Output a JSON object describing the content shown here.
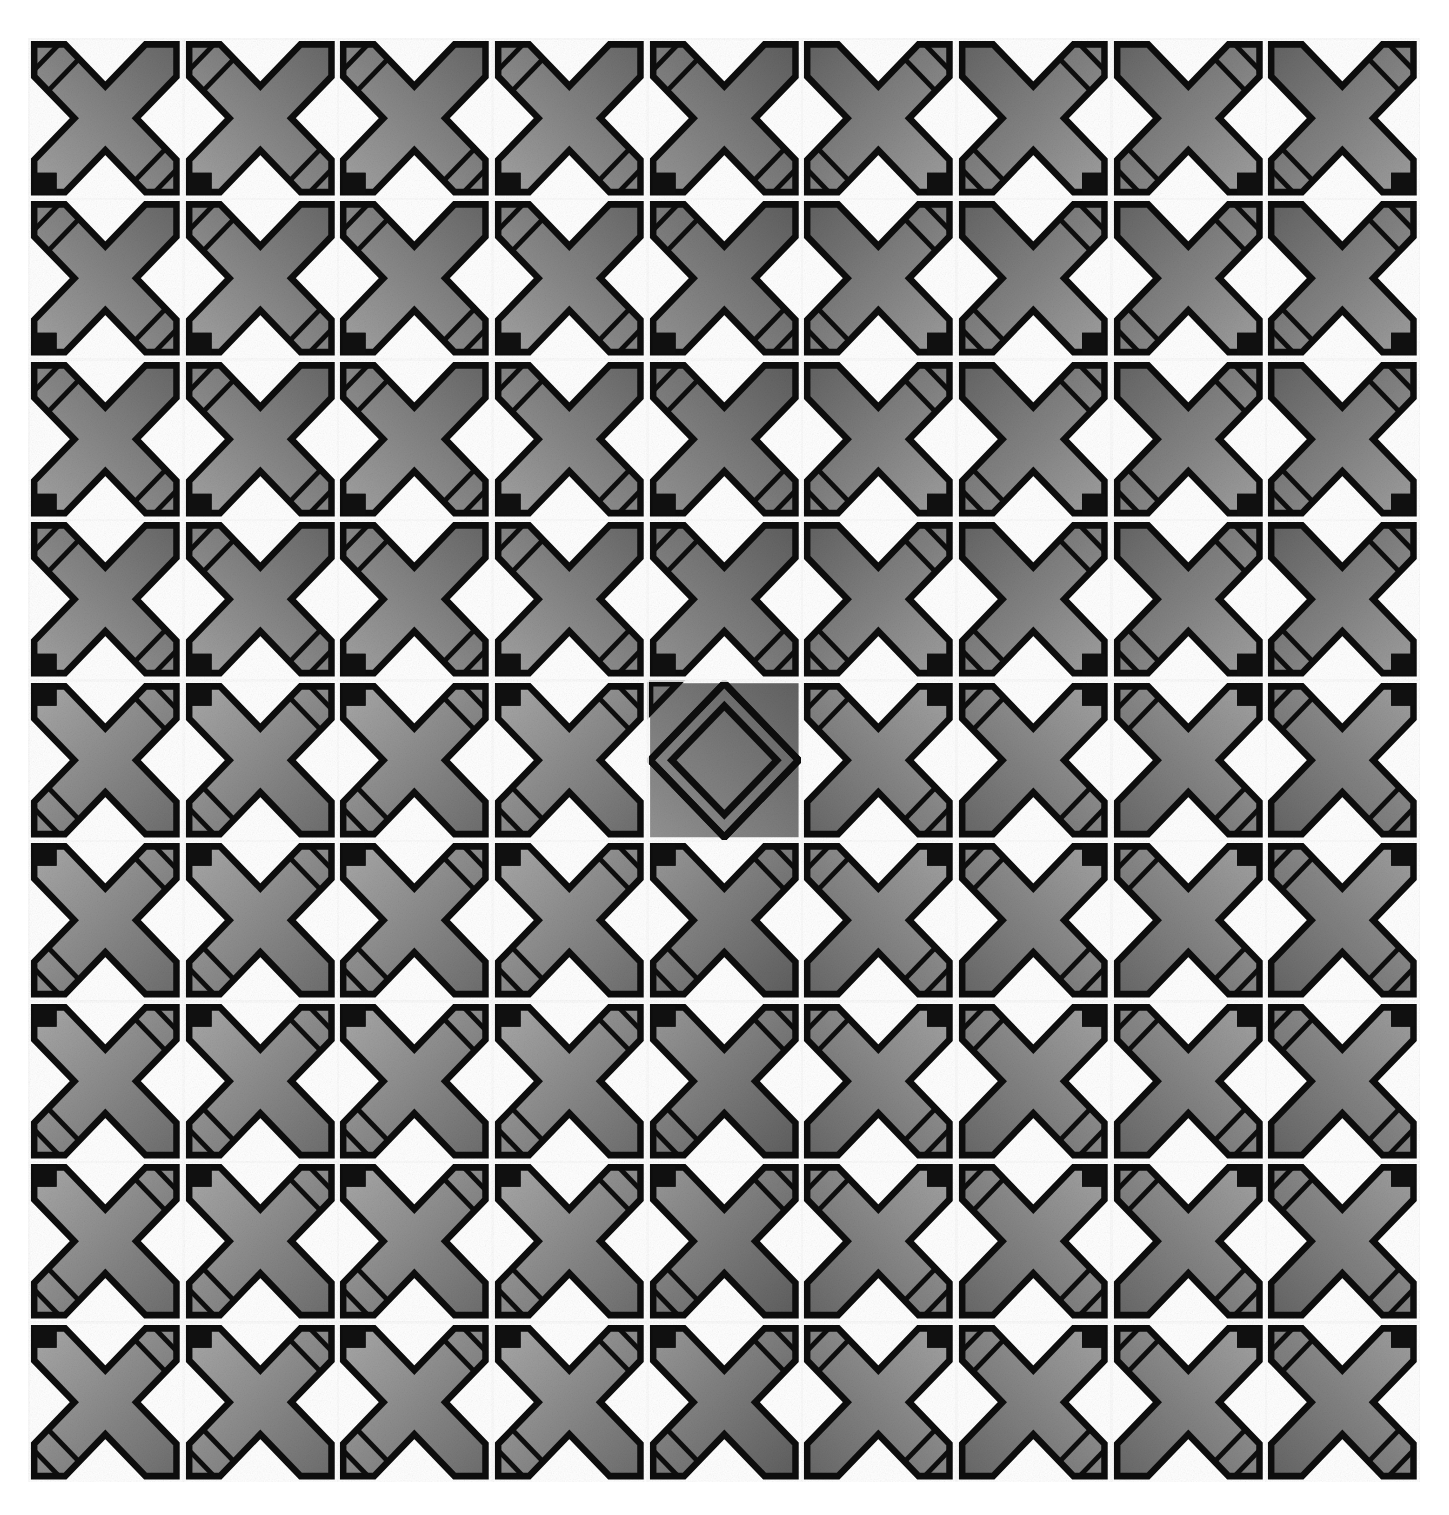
{
  "image": {
    "kind": "texture-pattern-grid",
    "description": "Grayscale grid of embossed metal-plate style cross tiles",
    "background_color": "#ffffff",
    "grid": {
      "columns": 9,
      "rows": 9,
      "left": 28,
      "top": 38,
      "width": 1392,
      "height": 1444,
      "gridline_color": "#fafafa"
    },
    "palette": {
      "tile_light": "#b4b4b4",
      "tile_mid": "#8c8c8c",
      "tile_dark": "#5e5e5e",
      "outline": "#0d0d0d",
      "gap": "#ffffff",
      "corner_stud": "#101010"
    },
    "tile_variants": {
      "cross": "cross-plate-tile",
      "diamond": "diamond-plate-tile"
    },
    "quadrant_orientations": {
      "top_left": "o-tl",
      "top_right": "o-tr",
      "bottom_left": "o-bl",
      "bottom_right": "o-br"
    },
    "anomaly": {
      "row": 5,
      "col": 5,
      "variant": "diamond",
      "note": "concentric rotated-square tile differs from surrounding cross tiles"
    }
  },
  "chart_data": {
    "type": "heatmap",
    "title": "",
    "xlabel": "",
    "ylabel": "",
    "categories_x": [
      "1",
      "2",
      "3",
      "4",
      "5",
      "6",
      "7",
      "8",
      "9"
    ],
    "categories_y": [
      "1",
      "2",
      "3",
      "4",
      "5",
      "6",
      "7",
      "8",
      "9"
    ],
    "legend": [],
    "grid": true,
    "cells": [
      [
        {
          "v": "cross",
          "o": "o-tl",
          "t": 0.55
        },
        {
          "v": "cross",
          "o": "o-tl",
          "t": 0.55
        },
        {
          "v": "cross",
          "o": "o-tl",
          "t": 0.55
        },
        {
          "v": "cross",
          "o": "o-tl",
          "t": 0.55
        },
        {
          "v": "cross",
          "o": "o-tl",
          "t": 0.7
        },
        {
          "v": "cross",
          "o": "o-tr",
          "t": 0.6
        },
        {
          "v": "cross",
          "o": "o-tr",
          "t": 0.58
        },
        {
          "v": "cross",
          "o": "o-tr",
          "t": 0.58
        },
        {
          "v": "cross",
          "o": "o-tr",
          "t": 0.6
        }
      ],
      [
        {
          "v": "cross",
          "o": "o-tl",
          "t": 0.55
        },
        {
          "v": "cross",
          "o": "o-tl",
          "t": 0.55
        },
        {
          "v": "cross",
          "o": "o-tl",
          "t": 0.55
        },
        {
          "v": "cross",
          "o": "o-tl",
          "t": 0.55
        },
        {
          "v": "cross",
          "o": "o-tl",
          "t": 0.72
        },
        {
          "v": "cross",
          "o": "o-tr",
          "t": 0.62
        },
        {
          "v": "cross",
          "o": "o-tr",
          "t": 0.58
        },
        {
          "v": "cross",
          "o": "o-tr",
          "t": 0.58
        },
        {
          "v": "cross",
          "o": "o-tr",
          "t": 0.6
        }
      ],
      [
        {
          "v": "cross",
          "o": "o-tl",
          "t": 0.55
        },
        {
          "v": "cross",
          "o": "o-tl",
          "t": 0.55
        },
        {
          "v": "cross",
          "o": "o-tl",
          "t": 0.55
        },
        {
          "v": "cross",
          "o": "o-tl",
          "t": 0.55
        },
        {
          "v": "cross",
          "o": "o-tl",
          "t": 0.72
        },
        {
          "v": "cross",
          "o": "o-tr",
          "t": 0.6
        },
        {
          "v": "cross",
          "o": "o-tr",
          "t": 0.58
        },
        {
          "v": "cross",
          "o": "o-tr",
          "t": 0.58
        },
        {
          "v": "cross",
          "o": "o-tr",
          "t": 0.6
        }
      ],
      [
        {
          "v": "cross",
          "o": "o-tl",
          "t": 0.55
        },
        {
          "v": "cross",
          "o": "o-tl",
          "t": 0.55
        },
        {
          "v": "cross",
          "o": "o-tl",
          "t": 0.55
        },
        {
          "v": "cross",
          "o": "o-tl",
          "t": 0.55
        },
        {
          "v": "cross",
          "o": "o-tl",
          "t": 0.72
        },
        {
          "v": "cross",
          "o": "o-tr",
          "t": 0.6
        },
        {
          "v": "cross",
          "o": "o-tr",
          "t": 0.58
        },
        {
          "v": "cross",
          "o": "o-tr",
          "t": 0.58
        },
        {
          "v": "cross",
          "o": "o-tr",
          "t": 0.6
        }
      ],
      [
        {
          "v": "cross",
          "o": "o-bl",
          "t": 0.48
        },
        {
          "v": "cross",
          "o": "o-bl",
          "t": 0.48
        },
        {
          "v": "cross",
          "o": "o-bl",
          "t": 0.48
        },
        {
          "v": "cross",
          "o": "o-bl",
          "t": 0.48
        },
        {
          "v": "diamond",
          "o": "o-tl",
          "t": 0.7
        },
        {
          "v": "cross",
          "o": "o-br",
          "t": 0.55
        },
        {
          "v": "cross",
          "o": "o-br",
          "t": 0.55
        },
        {
          "v": "cross",
          "o": "o-br",
          "t": 0.55
        },
        {
          "v": "cross",
          "o": "o-br",
          "t": 0.58
        }
      ],
      [
        {
          "v": "cross",
          "o": "o-bl",
          "t": 0.48
        },
        {
          "v": "cross",
          "o": "o-bl",
          "t": 0.48
        },
        {
          "v": "cross",
          "o": "o-bl",
          "t": 0.48
        },
        {
          "v": "cross",
          "o": "o-bl",
          "t": 0.48
        },
        {
          "v": "cross",
          "o": "o-bl",
          "t": 0.66
        },
        {
          "v": "cross",
          "o": "o-br",
          "t": 0.55
        },
        {
          "v": "cross",
          "o": "o-br",
          "t": 0.55
        },
        {
          "v": "cross",
          "o": "o-br",
          "t": 0.55
        },
        {
          "v": "cross",
          "o": "o-br",
          "t": 0.58
        }
      ],
      [
        {
          "v": "cross",
          "o": "o-bl",
          "t": 0.48
        },
        {
          "v": "cross",
          "o": "o-bl",
          "t": 0.48
        },
        {
          "v": "cross",
          "o": "o-bl",
          "t": 0.48
        },
        {
          "v": "cross",
          "o": "o-bl",
          "t": 0.48
        },
        {
          "v": "cross",
          "o": "o-bl",
          "t": 0.66
        },
        {
          "v": "cross",
          "o": "o-br",
          "t": 0.55
        },
        {
          "v": "cross",
          "o": "o-br",
          "t": 0.55
        },
        {
          "v": "cross",
          "o": "o-br",
          "t": 0.55
        },
        {
          "v": "cross",
          "o": "o-br",
          "t": 0.58
        }
      ],
      [
        {
          "v": "cross",
          "o": "o-bl",
          "t": 0.48
        },
        {
          "v": "cross",
          "o": "o-bl",
          "t": 0.48
        },
        {
          "v": "cross",
          "o": "o-bl",
          "t": 0.48
        },
        {
          "v": "cross",
          "o": "o-bl",
          "t": 0.48
        },
        {
          "v": "cross",
          "o": "o-bl",
          "t": 0.66
        },
        {
          "v": "cross",
          "o": "o-br",
          "t": 0.55
        },
        {
          "v": "cross",
          "o": "o-br",
          "t": 0.55
        },
        {
          "v": "cross",
          "o": "o-br",
          "t": 0.55
        },
        {
          "v": "cross",
          "o": "o-br",
          "t": 0.58
        }
      ],
      [
        {
          "v": "cross",
          "o": "o-bl",
          "t": 0.48
        },
        {
          "v": "cross",
          "o": "o-bl",
          "t": 0.48
        },
        {
          "v": "cross",
          "o": "o-bl",
          "t": 0.48
        },
        {
          "v": "cross",
          "o": "o-bl",
          "t": 0.48
        },
        {
          "v": "cross",
          "o": "o-bl",
          "t": 0.66
        },
        {
          "v": "cross",
          "o": "o-br",
          "t": 0.55
        },
        {
          "v": "cross",
          "o": "o-br",
          "t": 0.55
        },
        {
          "v": "cross",
          "o": "o-br",
          "t": 0.55
        },
        {
          "v": "cross",
          "o": "o-br",
          "t": 0.58
        }
      ]
    ]
  }
}
